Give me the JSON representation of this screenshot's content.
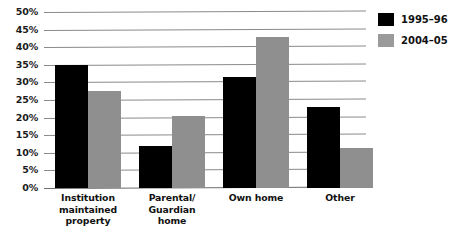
{
  "chart_data": {
    "type": "bar",
    "title": "",
    "xlabel": "",
    "ylabel": "",
    "ylim": [
      0,
      50
    ],
    "ytick_step": 5,
    "grid": true,
    "legend_position": "right",
    "categories": [
      "Institution maintained property",
      "Parental/ Guardian home",
      "Own home",
      "Other"
    ],
    "category_lines": [
      [
        "Institution",
        "maintained",
        "property"
      ],
      [
        "Parental/",
        "Guardian",
        "home"
      ],
      [
        "Own home"
      ],
      [
        "Other"
      ]
    ],
    "ytick_labels": [
      "50%",
      "45%",
      "40%",
      "35%",
      "30%",
      "25%",
      "20%",
      "15%",
      "10%",
      "5%",
      "0%"
    ],
    "series": [
      {
        "name": "1995–96",
        "color": "#000000",
        "values": [
          35,
          12,
          31.5,
          23
        ]
      },
      {
        "name": "2004–05",
        "color": "#8f8f8f",
        "values": [
          27.5,
          20.5,
          43,
          11.5
        ]
      }
    ]
  },
  "legend": {
    "items": [
      {
        "label": "1995–96",
        "color": "#000000"
      },
      {
        "label": "2004–05",
        "color": "#9a9a9a"
      }
    ]
  }
}
